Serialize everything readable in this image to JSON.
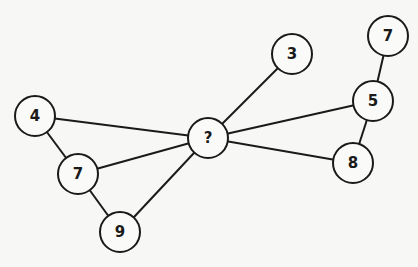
{
  "diagram": {
    "type": "number-graph-puzzle",
    "stroke_color": "#1a1a1a",
    "nodes": [
      {
        "id": "center",
        "label": "?",
        "x": 208,
        "y": 138
      },
      {
        "id": "n3",
        "label": "3",
        "x": 292,
        "y": 54
      },
      {
        "id": "n7top",
        "label": "7",
        "x": 388,
        "y": 36
      },
      {
        "id": "n5",
        "label": "5",
        "x": 373,
        "y": 101
      },
      {
        "id": "n8",
        "label": "8",
        "x": 353,
        "y": 163
      },
      {
        "id": "n4",
        "label": "4",
        "x": 35,
        "y": 116
      },
      {
        "id": "n7left",
        "label": "7",
        "x": 78,
        "y": 174
      },
      {
        "id": "n9",
        "label": "9",
        "x": 120,
        "y": 232
      }
    ],
    "edges": [
      [
        "center",
        "n3"
      ],
      [
        "center",
        "n5"
      ],
      [
        "center",
        "n8"
      ],
      [
        "center",
        "n4"
      ],
      [
        "center",
        "n7left"
      ],
      [
        "center",
        "n9"
      ],
      [
        "n7top",
        "n5"
      ],
      [
        "n5",
        "n8"
      ],
      [
        "n4",
        "n7left"
      ],
      [
        "n7left",
        "n9"
      ]
    ]
  }
}
